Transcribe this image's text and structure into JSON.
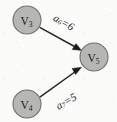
{
  "diagram": {
    "background_color": "#fbfbfa",
    "node_fill_color": "#b6b6b4",
    "node_stroke_color": "#6f6f6d",
    "ink_color": "#1d1d1d",
    "nodes": [
      {
        "id": "v3",
        "base": "V",
        "subscript": "3",
        "label": "V3",
        "cx": 27,
        "cy": 20,
        "r": 14
      },
      {
        "id": "v5",
        "base": "V",
        "subscript": "5",
        "label": "V5",
        "cx": 94,
        "cy": 57,
        "r": 14
      },
      {
        "id": "v4",
        "base": "V",
        "subscript": "4",
        "label": "V4",
        "cx": 27,
        "cy": 104,
        "r": 14
      }
    ],
    "edges": [
      {
        "id": "a6",
        "from": "v3",
        "to": "v5",
        "directed": true,
        "label_base": "a",
        "label_subscript": "6",
        "label_value": "=6",
        "label": "a6=6",
        "weight": 6,
        "label_x": 64,
        "label_y": 22,
        "label_rotation": 30
      },
      {
        "id": "a7",
        "from": "v4",
        "to": "v5",
        "directed": true,
        "label_base": "a",
        "label_subscript": "7",
        "label_value": "=5",
        "label": "a7=5",
        "weight": 5,
        "label_x": 66,
        "label_y": 101,
        "label_rotation": -30
      }
    ]
  }
}
